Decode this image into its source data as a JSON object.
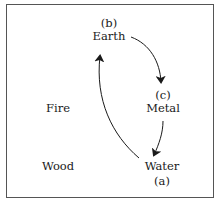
{
  "diagram": {
    "nodes": [
      {
        "id": "earth",
        "label": "Earth",
        "tag": "(b)"
      },
      {
        "id": "metal",
        "label": "Metal",
        "tag": "(c)"
      },
      {
        "id": "water",
        "label": "Water",
        "tag": "(a)"
      },
      {
        "id": "fire",
        "label": "Fire"
      },
      {
        "id": "wood",
        "label": "Wood"
      }
    ],
    "edges": [
      {
        "from": "water",
        "to": "earth"
      },
      {
        "from": "earth",
        "to": "metal"
      },
      {
        "from": "metal",
        "to": "water"
      }
    ]
  }
}
